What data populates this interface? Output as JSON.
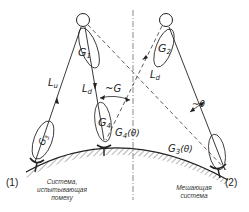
{
  "diagram": {
    "title": "",
    "nodes": {
      "satellite_1": {
        "label": "G1",
        "symbol": "G",
        "sub": "1"
      },
      "satellite_2": {
        "label": "G2",
        "symbol": "G",
        "sub": "2"
      },
      "station_1": {
        "label": "G3",
        "symbol": "G",
        "sub": "3"
      },
      "station_2": {
        "label": "G4",
        "symbol": "G",
        "sub": "4"
      }
    },
    "labels": {
      "Lu": {
        "main": "L",
        "sub": "u"
      },
      "Ld_left": {
        "main": "L",
        "sub": "d"
      },
      "Ld_right": {
        "main": "L",
        "sub": "d"
      },
      "tilde_G": "~G",
      "tilde_theta": "~θ",
      "G4_theta": {
        "main": "G",
        "sub": "4",
        "arg": "(θ)"
      },
      "G3_theta": {
        "main": "G",
        "sub": "3",
        "arg": "(θ)"
      }
    },
    "markers": {
      "left": "(1)",
      "right": "(2)"
    },
    "captions": {
      "left_line1": "Система,",
      "left_line2": "испытывающая",
      "left_line3": "помеху",
      "right_line1": "Мешающая",
      "right_line2": "система"
    },
    "colors": {
      "line": "#333333",
      "text": "#222222",
      "background": "#ffffff"
    }
  }
}
